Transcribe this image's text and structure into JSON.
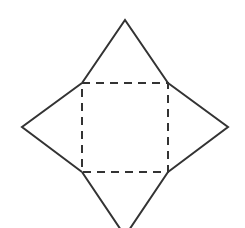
{
  "diagram": {
    "stroke_color": "#333333",
    "background": "#ffffff",
    "stroke_width": 2,
    "dash_pattern": "8 6",
    "square": {
      "x": 82,
      "y": 83,
      "width": 86,
      "height": 89,
      "style": "dashed"
    },
    "triangles": [
      {
        "name": "top",
        "points": "82,83 125,20 168,83"
      },
      {
        "name": "right",
        "points": "168,83 228,127 168,172"
      },
      {
        "name": "bottom",
        "points": "168,172 125,236 82,172"
      },
      {
        "name": "left",
        "points": "82,172 22,127 82,83"
      }
    ]
  }
}
